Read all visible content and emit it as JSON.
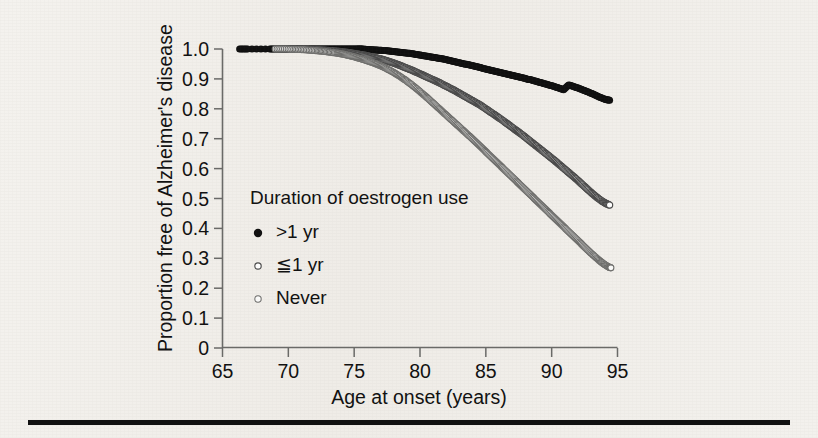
{
  "chart_data": {
    "type": "line",
    "title": "",
    "subtitle": "",
    "xlabel": "Age at onset (years)",
    "ylabel": "Proportion free of Alzheimer's disease",
    "xlim": [
      65,
      95
    ],
    "ylim": [
      0,
      1.0
    ],
    "xticks": [
      65,
      70,
      75,
      80,
      85,
      90,
      95
    ],
    "xtick_labels": [
      "65",
      "70",
      "75",
      "80",
      "85",
      "90",
      "95"
    ],
    "yticks": [
      0,
      0.1,
      0.2,
      0.3,
      0.4,
      0.5,
      0.6,
      0.7,
      0.8,
      0.9,
      1.0
    ],
    "ytick_labels": [
      "0",
      "0.1",
      "0.2",
      "0.3",
      "0.4",
      "0.5",
      "0.6",
      "0.7",
      "0.8",
      "0.9",
      "1.0"
    ],
    "grid": false,
    "legend_position": "center-left-inside",
    "legend_title": "Duration of oestrogen use",
    "series": [
      {
        "name": ">1 yr",
        "marker": "filled-circle",
        "color": "#101010",
        "x": [
          66.3,
          66.9,
          68.6,
          69.1,
          69.6,
          70.1,
          70.6,
          71.1,
          71.6,
          72.0,
          72.4,
          72.8,
          73.2,
          73.6,
          74.0,
          74.4,
          74.8,
          75.2,
          75.5,
          75.8,
          76.1,
          76.5,
          76.9,
          77.3,
          77.7,
          78.1,
          78.5,
          78.9,
          79.3,
          79.7,
          80.1,
          80.5,
          80.9,
          81.3,
          81.7,
          82.1,
          82.5,
          82.9,
          83.3,
          83.7,
          84.1,
          84.5,
          84.9,
          85.3,
          85.7,
          86.1,
          86.5,
          86.9,
          87.3,
          87.7,
          88.1,
          88.5,
          88.9,
          89.3,
          89.7,
          90.1,
          90.5,
          90.9,
          91.3,
          91.7,
          92.1,
          92.5,
          92.9,
          93.3,
          93.7,
          94.1,
          94.4
        ],
        "y": [
          1.0,
          1.0,
          1.0,
          1.0,
          1.0,
          1.0,
          1.0,
          1.0,
          1.0,
          1.0,
          1.0,
          1.0,
          1.0,
          1.0,
          1.0,
          1.0,
          1.0,
          1.0,
          1.0,
          0.999,
          0.998,
          0.997,
          0.996,
          0.995,
          0.993,
          0.991,
          0.989,
          0.987,
          0.985,
          0.982,
          0.979,
          0.976,
          0.973,
          0.97,
          0.967,
          0.963,
          0.959,
          0.955,
          0.951,
          0.947,
          0.943,
          0.939,
          0.934,
          0.93,
          0.926,
          0.921,
          0.917,
          0.913,
          0.909,
          0.905,
          0.9,
          0.896,
          0.891,
          0.886,
          0.881,
          0.876,
          0.87,
          0.864,
          0.88,
          0.874,
          0.868,
          0.861,
          0.854,
          0.846,
          0.838,
          0.831,
          0.829
        ]
      },
      {
        "name": "≦1 yr",
        "marker": "open-circle",
        "color": "#4a4a4a",
        "x": [
          69.4,
          70.0,
          70.6,
          71.2,
          71.8,
          72.3,
          72.8,
          73.3,
          73.8,
          74.2,
          74.6,
          75.0,
          75.4,
          75.8,
          76.2,
          76.6,
          77.0,
          77.4,
          77.8,
          78.2,
          78.6,
          79.0,
          79.4,
          79.8,
          80.2,
          80.6,
          81.0,
          81.4,
          81.8,
          82.2,
          82.6,
          83.0,
          83.4,
          83.8,
          84.2,
          84.6,
          85.0,
          85.4,
          85.8,
          86.2,
          86.6,
          87.0,
          87.4,
          87.8,
          88.2,
          88.6,
          89.0,
          89.4,
          89.8,
          90.2,
          90.6,
          91.0,
          91.4,
          91.8,
          92.2,
          92.6,
          93.0,
          93.4,
          93.8,
          94.1,
          94.4
        ],
        "y": [
          1.0,
          1.0,
          1.0,
          0.999,
          0.998,
          0.997,
          0.996,
          0.994,
          0.992,
          0.99,
          0.988,
          0.985,
          0.982,
          0.979,
          0.975,
          0.971,
          0.967,
          0.962,
          0.956,
          0.95,
          0.943,
          0.936,
          0.929,
          0.921,
          0.913,
          0.905,
          0.897,
          0.889,
          0.88,
          0.871,
          0.862,
          0.852,
          0.842,
          0.832,
          0.822,
          0.812,
          0.8,
          0.788,
          0.776,
          0.764,
          0.751,
          0.738,
          0.725,
          0.712,
          0.698,
          0.684,
          0.67,
          0.656,
          0.642,
          0.628,
          0.613,
          0.598,
          0.583,
          0.568,
          0.552,
          0.536,
          0.52,
          0.505,
          0.492,
          0.484,
          0.478
        ]
      },
      {
        "name": "Never",
        "marker": "open-circle-small",
        "color": "#6e6e6c",
        "x": [
          69.0,
          69.7,
          70.4,
          71.0,
          71.6,
          72.2,
          72.7,
          73.2,
          73.7,
          74.1,
          74.5,
          74.9,
          75.3,
          75.7,
          76.1,
          76.5,
          76.9,
          77.3,
          77.7,
          78.1,
          78.5,
          78.9,
          79.3,
          79.7,
          80.1,
          80.5,
          80.9,
          81.3,
          81.7,
          82.1,
          82.5,
          82.9,
          83.3,
          83.7,
          84.1,
          84.5,
          84.9,
          85.3,
          85.7,
          86.1,
          86.5,
          86.9,
          87.3,
          87.7,
          88.1,
          88.5,
          88.9,
          89.3,
          89.7,
          90.1,
          90.5,
          90.9,
          91.3,
          91.7,
          92.1,
          92.5,
          92.9,
          93.3,
          93.7,
          94.0,
          94.3,
          94.5
        ],
        "y": [
          1.0,
          1.0,
          0.999,
          0.998,
          0.996,
          0.994,
          0.992,
          0.989,
          0.986,
          0.983,
          0.979,
          0.975,
          0.97,
          0.965,
          0.959,
          0.953,
          0.946,
          0.938,
          0.929,
          0.919,
          0.908,
          0.896,
          0.883,
          0.869,
          0.854,
          0.839,
          0.823,
          0.807,
          0.791,
          0.775,
          0.759,
          0.743,
          0.727,
          0.711,
          0.695,
          0.678,
          0.661,
          0.644,
          0.627,
          0.61,
          0.593,
          0.576,
          0.559,
          0.542,
          0.525,
          0.508,
          0.491,
          0.474,
          0.457,
          0.44,
          0.423,
          0.406,
          0.389,
          0.372,
          0.355,
          0.338,
          0.321,
          0.305,
          0.29,
          0.28,
          0.272,
          0.268
        ]
      }
    ]
  },
  "legend": {
    "title": "Duration of oestrogen use",
    "items": [
      {
        "label": ">1 yr",
        "marker": "filled-circle-marker"
      },
      {
        "label": "≦1 yr",
        "marker": "open-circle-marker"
      },
      {
        "label": "Never",
        "marker": "open-circle-small-marker"
      }
    ]
  },
  "axes": {
    "x_title": "Age at onset (years)",
    "y_title": "Proportion free of Alzheimer's disease"
  }
}
